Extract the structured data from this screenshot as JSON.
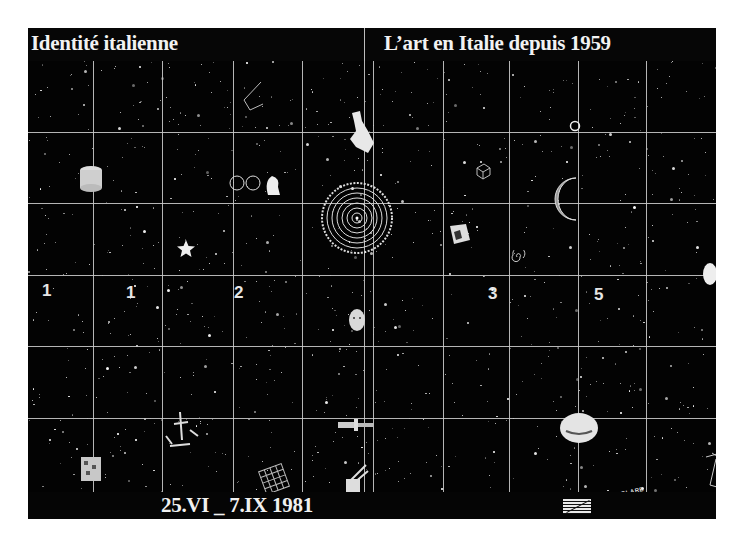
{
  "poster": {
    "header": {
      "left_title": "Identité italienne",
      "right_title": "L’art en Italie depuis 1959"
    },
    "footer": {
      "dates": "25.VI _ 7.IX 1981",
      "logo_icon": "striped-logo-icon"
    },
    "grid": {
      "columns": 10,
      "rows": 6
    },
    "artworks": {
      "digits": [
        "1",
        "1",
        "2",
        "3",
        "5"
      ],
      "curved_text": "PARTICOLARE"
    },
    "colors": {
      "background": "#030303",
      "grid_lines": "#c9c9c9",
      "text": "#f2f2f2"
    }
  }
}
